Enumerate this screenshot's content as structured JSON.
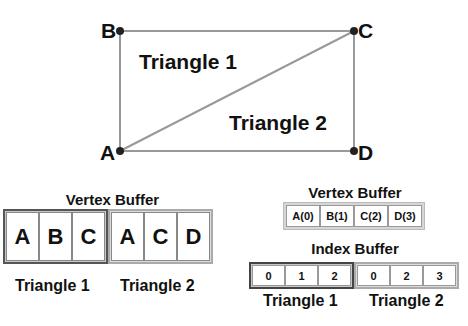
{
  "diagram": {
    "vertices": [
      {
        "id": "A",
        "label": "A"
      },
      {
        "id": "B",
        "label": "B"
      },
      {
        "id": "C",
        "label": "C"
      },
      {
        "id": "D",
        "label": "D"
      }
    ],
    "edges": [
      [
        "A",
        "B"
      ],
      [
        "B",
        "C"
      ],
      [
        "C",
        "D"
      ],
      [
        "D",
        "A"
      ],
      [
        "A",
        "C"
      ]
    ],
    "triangle_labels": [
      "Triangle 1",
      "Triangle 2"
    ]
  },
  "left_panel": {
    "title": "Vertex Buffer",
    "triangle1": [
      "A",
      "B",
      "C"
    ],
    "triangle2": [
      "A",
      "C",
      "D"
    ],
    "captions": [
      "Triangle 1",
      "Triangle 2"
    ]
  },
  "right_panel": {
    "vertex_title": "Vertex Buffer",
    "vertex_cells": [
      "A(0)",
      "B(1)",
      "C(2)",
      "D(3)"
    ],
    "index_title": "Index Buffer",
    "triangle1": [
      "0",
      "1",
      "2"
    ],
    "triangle2": [
      "0",
      "2",
      "3"
    ],
    "captions": [
      "Triangle 1",
      "Triangle 2"
    ]
  }
}
